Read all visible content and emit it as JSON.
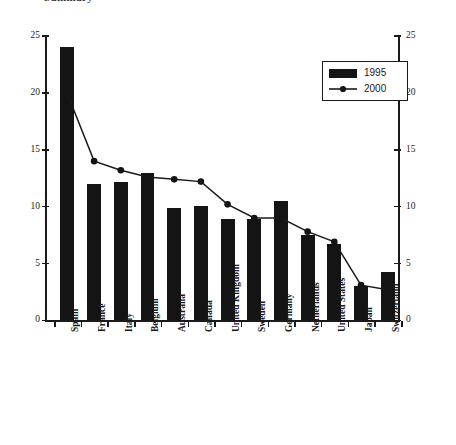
{
  "title": {
    "text": "Summary",
    "note": "top-cropped heading"
  },
  "legend": {
    "position": "upper-right",
    "entries": [
      {
        "label": "1995",
        "marker": "filled-bar-swatch"
      },
      {
        "label": "2000",
        "marker": "line-with-round-point"
      }
    ]
  },
  "axes": {
    "y_ticks": [
      "0",
      "5",
      "10",
      "15",
      "20",
      "25"
    ],
    "y_min": 0,
    "y_max": 25,
    "y_right_ticks": [
      "0",
      "5",
      "10",
      "15",
      "20",
      "25"
    ]
  },
  "colors": {
    "bar": "#141414",
    "line": "#1a1a1a",
    "axis": "#1a1a1a",
    "background": "#ffffff"
  },
  "chart_data": {
    "type": "bar",
    "title": "Summary",
    "xlabel": "",
    "ylabel": "",
    "ylim": [
      0,
      25
    ],
    "grid": false,
    "legend_position": "upper right",
    "categories": [
      "Spain",
      "France",
      "Italy",
      "Belgium",
      "Australia",
      "Canada",
      "United Kingdom",
      "Sweden",
      "Germany",
      "Netherlands",
      "United States",
      "Japan",
      "Switzerland"
    ],
    "series": [
      {
        "name": "1995",
        "type": "bar",
        "values": [
          24.0,
          12.0,
          12.2,
          13.0,
          9.9,
          10.1,
          8.9,
          8.9,
          10.5,
          7.5,
          6.7,
          3.0,
          4.3
        ]
      },
      {
        "name": "2000",
        "type": "line",
        "values": [
          19.9,
          14.0,
          13.2,
          12.6,
          12.4,
          12.2,
          10.2,
          9.0,
          9.0,
          7.8,
          6.9,
          3.1,
          2.7
        ]
      }
    ]
  }
}
